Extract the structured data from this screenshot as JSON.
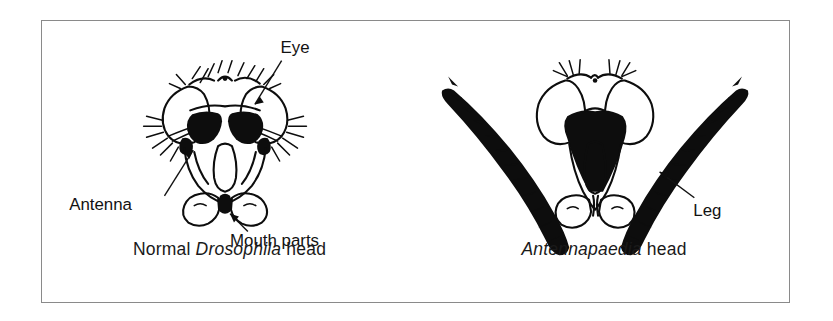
{
  "figure": {
    "background_color": "#ffffff",
    "frame_color": "#8a8a8a",
    "ink_color": "#0d0d0d"
  },
  "panels": [
    {
      "id": "normal",
      "caption_prefix": "Normal ",
      "caption_species": "Drosophila",
      "caption_suffix": " head",
      "labels": [
        {
          "name": "eye",
          "text": "Eye"
        },
        {
          "name": "antenna",
          "text": "Antenna"
        },
        {
          "name": "mouth-parts",
          "text": "Mouth parts"
        }
      ]
    },
    {
      "id": "mutant",
      "caption_prefix": "",
      "caption_species": "Antennapaedia",
      "caption_suffix": " head",
      "labels": [
        {
          "name": "leg",
          "text": "Leg"
        }
      ]
    }
  ]
}
